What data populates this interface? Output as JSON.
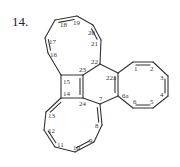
{
  "figure": {
    "number_label": "14.",
    "structure_name": "fused polycyclic hydrocarbon (four cyclooctatetraene rings around a cyclobutene and benzene core)"
  },
  "atoms": [
    {
      "id": "1",
      "x": 133,
      "y": 62,
      "lx": 134,
      "ly": 71
    },
    {
      "id": "2",
      "x": 153,
      "y": 62,
      "lx": 150,
      "ly": 71
    },
    {
      "id": "3",
      "x": 168,
      "y": 76,
      "lx": 160,
      "ly": 80
    },
    {
      "id": "4",
      "x": 168,
      "y": 96,
      "lx": 160,
      "ly": 97
    },
    {
      "id": "5",
      "x": 153,
      "y": 108,
      "lx": 150,
      "ly": 104
    },
    {
      "id": "6",
      "x": 133,
      "y": 108,
      "lx": 133,
      "ly": 104
    },
    {
      "id": "6a",
      "x": 118,
      "y": 96,
      "lx": 122,
      "ly": 98
    },
    {
      "id": "7",
      "x": 100,
      "y": 104,
      "lx": 99,
      "ly": 101
    },
    {
      "id": "8",
      "x": 102,
      "y": 125,
      "lx": 95,
      "ly": 128
    },
    {
      "id": "9",
      "x": 94,
      "y": 142,
      "lx": 89,
      "ly": 143
    },
    {
      "id": "10",
      "x": 75,
      "y": 152,
      "lx": 73,
      "ly": 150
    },
    {
      "id": "11",
      "x": 55,
      "y": 147,
      "lx": 57,
      "ly": 147
    },
    {
      "id": "12",
      "x": 44,
      "y": 130,
      "lx": 48,
      "ly": 133
    },
    {
      "id": "13",
      "x": 46,
      "y": 112,
      "lx": 48,
      "ly": 118
    },
    {
      "id": "14",
      "x": 61,
      "y": 98,
      "lx": 63,
      "ly": 96
    },
    {
      "id": "15",
      "x": 61,
      "y": 75,
      "lx": 63,
      "ly": 84
    },
    {
      "id": "16",
      "x": 48,
      "y": 53,
      "lx": 50,
      "ly": 57
    },
    {
      "id": "17",
      "x": 45,
      "y": 38,
      "lx": 49,
      "ly": 44
    },
    {
      "id": "18",
      "x": 55,
      "y": 20,
      "lx": 60,
      "ly": 27
    },
    {
      "id": "19",
      "x": 77,
      "y": 16,
      "lx": 73,
      "ly": 25
    },
    {
      "id": "20",
      "x": 93,
      "y": 25,
      "lx": 88,
      "ly": 35
    },
    {
      "id": "21",
      "x": 101,
      "y": 40,
      "lx": 91,
      "ly": 46
    },
    {
      "id": "22",
      "x": 100,
      "y": 64,
      "lx": 91,
      "ly": 64
    },
    {
      "id": "22a",
      "x": 118,
      "y": 73,
      "lx": 106,
      "ly": 80
    },
    {
      "id": "23",
      "x": 83,
      "y": 75,
      "lx": 79,
      "ly": 72
    },
    {
      "id": "24",
      "x": 83,
      "y": 98,
      "lx": 79,
      "ly": 106
    }
  ],
  "bonds": [
    {
      "a": "15",
      "b": "16",
      "order": 1
    },
    {
      "a": "16",
      "b": "17",
      "order": 2
    },
    {
      "a": "17",
      "b": "18",
      "order": 1
    },
    {
      "a": "18",
      "b": "19",
      "order": 2
    },
    {
      "a": "19",
      "b": "20",
      "order": 1
    },
    {
      "a": "20",
      "b": "21",
      "order": 2
    },
    {
      "a": "21",
      "b": "22",
      "order": 1
    },
    {
      "a": "22",
      "b": "23",
      "order": 1
    },
    {
      "a": "23",
      "b": "15",
      "order": 1
    },
    {
      "a": "15",
      "b": "14",
      "order": 1
    },
    {
      "a": "14",
      "b": "24",
      "order": 1
    },
    {
      "a": "24",
      "b": "23",
      "order": 2
    },
    {
      "a": "22",
      "b": "22a",
      "order": 1
    },
    {
      "a": "22a",
      "b": "6a",
      "order": 2
    },
    {
      "a": "6a",
      "b": "7",
      "order": 1
    },
    {
      "a": "7",
      "b": "24",
      "order": 1
    },
    {
      "a": "22a",
      "b": "1",
      "order": 1
    },
    {
      "a": "1",
      "b": "2",
      "order": 2
    },
    {
      "a": "2",
      "b": "3",
      "order": 1
    },
    {
      "a": "3",
      "b": "4",
      "order": 2
    },
    {
      "a": "4",
      "b": "5",
      "order": 1
    },
    {
      "a": "5",
      "b": "6",
      "order": 2
    },
    {
      "a": "6",
      "b": "6a",
      "order": 1
    },
    {
      "a": "14",
      "b": "13",
      "order": 2
    },
    {
      "a": "13",
      "b": "12",
      "order": 1
    },
    {
      "a": "12",
      "b": "11",
      "order": 2
    },
    {
      "a": "11",
      "b": "10",
      "order": 1
    },
    {
      "a": "10",
      "b": "9",
      "order": 2
    },
    {
      "a": "9",
      "b": "8",
      "order": 1
    },
    {
      "a": "8",
      "b": "7",
      "order": 2
    }
  ]
}
